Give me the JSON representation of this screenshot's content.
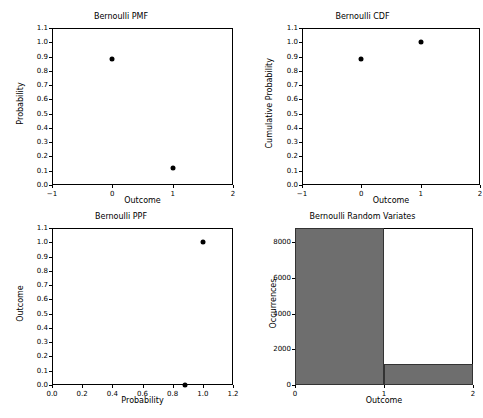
{
  "figure": {
    "width": 483,
    "height": 418,
    "background": "#ffffff",
    "marker_color": "#000000",
    "bar_fill_color": "#6e6e6e",
    "bar_edge_color": "#333333"
  },
  "chart_data": [
    {
      "type": "scatter",
      "title": "Bernoulli PMF",
      "xlabel": "Outcome",
      "ylabel": "Probability",
      "xlim": [
        -1,
        2
      ],
      "ylim": [
        0.0,
        1.1
      ],
      "xticks": [
        -1,
        0,
        1,
        2
      ],
      "xticklabels": [
        "−1",
        "0",
        "1",
        "2"
      ],
      "yticks": [
        0.0,
        0.1,
        0.2,
        0.3,
        0.4,
        0.5,
        0.6,
        0.7,
        0.8,
        0.9,
        1.0,
        1.1
      ],
      "yticklabels": [
        "0.0",
        "0.1",
        "0.2",
        "0.3",
        "0.4",
        "0.5",
        "0.6",
        "0.7",
        "0.8",
        "0.9",
        "1.0",
        "1.1"
      ],
      "grid": false,
      "legend": "none",
      "x": [
        0,
        1
      ],
      "y": [
        0.88,
        0.12
      ]
    },
    {
      "type": "scatter",
      "title": "Bernoulli CDF",
      "xlabel": "Outcome",
      "ylabel": "Cumulative Probability",
      "xlim": [
        -1,
        2
      ],
      "ylim": [
        0.0,
        1.1
      ],
      "xticks": [
        -1,
        0,
        1,
        2
      ],
      "xticklabels": [
        "−1",
        "0",
        "1",
        "2"
      ],
      "yticks": [
        0.0,
        0.1,
        0.2,
        0.3,
        0.4,
        0.5,
        0.6,
        0.7,
        0.8,
        0.9,
        1.0,
        1.1
      ],
      "yticklabels": [
        "0.0",
        "0.1",
        "0.2",
        "0.3",
        "0.4",
        "0.5",
        "0.6",
        "0.7",
        "0.8",
        "0.9",
        "1.0",
        "1.1"
      ],
      "grid": false,
      "legend": "none",
      "x": [
        0,
        1
      ],
      "y": [
        0.88,
        1.0
      ]
    },
    {
      "type": "scatter",
      "title": "Bernoulli PPF",
      "xlabel": "Probability",
      "ylabel": "Outcome",
      "xlim": [
        0.0,
        1.2
      ],
      "ylim": [
        0.0,
        1.1
      ],
      "xticks": [
        0.0,
        0.2,
        0.4,
        0.6,
        0.8,
        1.0,
        1.2
      ],
      "xticklabels": [
        "0.0",
        "0.2",
        "0.4",
        "0.6",
        "0.8",
        "1.0",
        "1.2"
      ],
      "yticks": [
        0.0,
        0.1,
        0.2,
        0.3,
        0.4,
        0.5,
        0.6,
        0.7,
        0.8,
        0.9,
        1.0,
        1.1
      ],
      "yticklabels": [
        "0.0",
        "0.1",
        "0.2",
        "0.3",
        "0.4",
        "0.5",
        "0.6",
        "0.7",
        "0.8",
        "0.9",
        "1.0",
        "1.1"
      ],
      "grid": false,
      "legend": "none",
      "x": [
        0.88,
        1.0
      ],
      "y": [
        0.0,
        1.0
      ]
    },
    {
      "type": "bar",
      "title": "Bernoulli Random Variates",
      "xlabel": "Outcome",
      "ylabel": "Occurrences",
      "xlim": [
        0,
        2
      ],
      "ylim": [
        0,
        8800
      ],
      "xticks": [
        0,
        1,
        2
      ],
      "xticklabels": [
        "0",
        "1",
        "2"
      ],
      "yticks": [
        0,
        2000,
        4000,
        6000,
        8000
      ],
      "yticklabels": [
        "0",
        "2000",
        "4000",
        "6000",
        "8000"
      ],
      "grid": false,
      "legend": "none",
      "bin_edges": [
        0,
        1,
        2
      ],
      "categories": [
        "0",
        "1"
      ],
      "values": [
        8800,
        1150
      ]
    }
  ]
}
